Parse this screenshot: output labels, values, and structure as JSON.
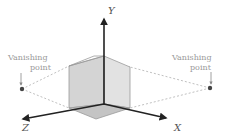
{
  "diagram": {
    "type": "two-point perspective with 3D axes",
    "axes": {
      "x_label": "X",
      "y_label": "Y",
      "z_label": "Z"
    },
    "vanishing_points": [
      {
        "side": "left",
        "label_line1": "Vanishing",
        "label_line2": "point"
      },
      {
        "side": "right",
        "label_line1": "Vanishing",
        "label_line2": "point"
      }
    ],
    "colors": {
      "axis": "#222222",
      "cube_face": "#cfcfcf",
      "cube_edge": "#9a9a9a",
      "dashed_line": "#b0b0b0",
      "label": "#9a9a9a"
    }
  }
}
